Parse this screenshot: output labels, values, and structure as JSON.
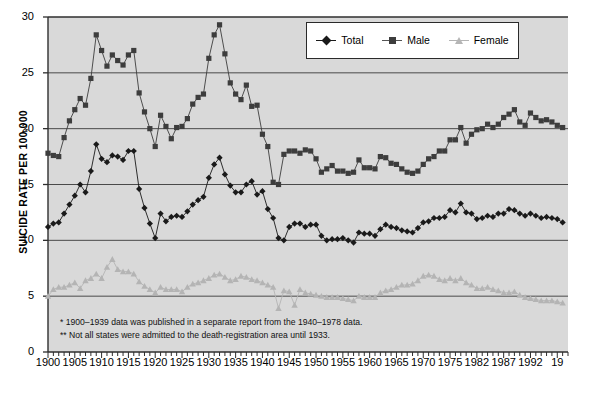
{
  "chart_data": {
    "type": "line",
    "title": "",
    "xlabel": "",
    "ylabel": "SUICIDE RATE PER 100,000",
    "ylim": [
      0,
      30
    ],
    "yticks": [
      0,
      5,
      10,
      15,
      20,
      25,
      30
    ],
    "xlim": [
      1900,
      1997
    ],
    "xtick_labels": [
      "1900",
      "1905",
      "1910",
      "1915",
      "1920",
      "1925",
      "1930",
      "1935",
      "1940",
      "1945",
      "1950",
      "1955",
      "1960",
      "1965",
      "1970",
      "1975",
      "1982",
      "1987",
      "1992",
      "19"
    ],
    "xtick_years": [
      1900,
      1905,
      1910,
      1915,
      1920,
      1925,
      1930,
      1935,
      1940,
      1945,
      1950,
      1955,
      1960,
      1965,
      1970,
      1975,
      1980,
      1985,
      1990,
      1995
    ],
    "grid": "horizontal",
    "legend_position": "top-right",
    "plot_background": "#d9d9d9",
    "x": [
      1900,
      1901,
      1902,
      1903,
      1904,
      1905,
      1906,
      1907,
      1908,
      1909,
      1910,
      1911,
      1912,
      1913,
      1914,
      1915,
      1916,
      1917,
      1918,
      1919,
      1920,
      1921,
      1922,
      1923,
      1924,
      1925,
      1926,
      1927,
      1928,
      1929,
      1930,
      1931,
      1932,
      1933,
      1934,
      1935,
      1936,
      1937,
      1938,
      1939,
      1940,
      1941,
      1942,
      1943,
      1944,
      1945,
      1946,
      1947,
      1948,
      1949,
      1950,
      1951,
      1952,
      1953,
      1954,
      1955,
      1956,
      1957,
      1958,
      1959,
      1960,
      1961,
      1962,
      1963,
      1964,
      1965,
      1966,
      1967,
      1968,
      1969,
      1970,
      1971,
      1972,
      1973,
      1974,
      1975,
      1976,
      1977,
      1978,
      1979,
      1980,
      1981,
      1982,
      1983,
      1984,
      1985,
      1986,
      1987,
      1988,
      1989,
      1990,
      1991,
      1992,
      1993,
      1994,
      1995,
      1996
    ],
    "series": [
      {
        "name": "Total",
        "color": "#1a1a1a",
        "marker": "diamond",
        "values": [
          11.2,
          11.5,
          11.6,
          12.4,
          13.2,
          14.0,
          15.0,
          14.3,
          16.2,
          18.6,
          17.3,
          17.0,
          17.6,
          17.5,
          17.2,
          18.0,
          18.0,
          14.6,
          12.9,
          11.5,
          10.2,
          12.4,
          11.7,
          12.1,
          12.2,
          12.1,
          12.6,
          13.2,
          13.6,
          13.9,
          15.6,
          16.8,
          17.4,
          15.9,
          14.9,
          14.3,
          14.3,
          15.0,
          15.3,
          14.1,
          14.4,
          12.8,
          12.0,
          10.2,
          10.0,
          11.2,
          11.5,
          11.5,
          11.2,
          11.4,
          11.4,
          10.4,
          10.0,
          10.1,
          10.1,
          10.2,
          10.0,
          9.8,
          10.7,
          10.6,
          10.6,
          10.4,
          11.0,
          11.4,
          11.2,
          11.1,
          10.9,
          10.8,
          10.7,
          11.1,
          11.6,
          11.7,
          12.0,
          12.0,
          12.1,
          12.7,
          12.5,
          13.3,
          12.5,
          12.4,
          11.9,
          12.0,
          12.2,
          12.1,
          12.4,
          12.4,
          12.8,
          12.7,
          12.4,
          12.2,
          12.4,
          12.2,
          12.0,
          12.1,
          12.0,
          11.9,
          11.6
        ]
      },
      {
        "name": "Male",
        "color": "#3d3d3d",
        "marker": "square",
        "values": [
          17.8,
          17.6,
          17.5,
          19.2,
          20.7,
          21.7,
          22.7,
          22.1,
          24.5,
          28.4,
          27.0,
          25.6,
          26.6,
          26.1,
          25.7,
          26.6,
          27.0,
          23.2,
          21.5,
          20.0,
          18.4,
          21.2,
          20.2,
          19.1,
          20.1,
          20.2,
          20.9,
          22.2,
          22.8,
          23.1,
          26.3,
          28.4,
          29.3,
          26.7,
          24.1,
          23.1,
          22.6,
          23.9,
          22.0,
          22.1,
          19.5,
          18.4,
          15.2,
          15.0,
          17.7,
          18.0,
          18.0,
          17.8,
          18.1,
          18.0,
          17.3,
          16.1,
          16.4,
          16.7,
          16.2,
          16.2,
          16.0,
          16.1,
          17.2,
          16.5,
          16.5,
          16.4,
          17.5,
          17.4,
          16.9,
          16.8,
          16.4,
          16.1,
          16.0,
          16.2,
          16.8,
          17.3,
          17.5,
          18.0,
          18.0,
          19.0,
          19.0,
          20.1,
          18.7,
          19.5,
          19.9,
          20.0,
          20.4,
          20.1,
          20.4,
          21.0,
          21.3,
          21.7,
          20.6,
          20.3,
          21.4,
          21.0,
          20.7,
          20.8,
          20.6,
          20.3,
          20.1
        ]
      },
      {
        "name": "Female",
        "color": "#b4b4b4",
        "marker": "triangle",
        "values": [
          5.0,
          5.6,
          5.8,
          5.8,
          6.0,
          6.2,
          5.7,
          6.4,
          6.6,
          7.0,
          6.6,
          7.6,
          8.3,
          7.4,
          7.2,
          7.2,
          7.0,
          6.3,
          5.9,
          5.6,
          5.3,
          5.8,
          5.6,
          5.6,
          5.6,
          5.4,
          5.8,
          6.1,
          6.2,
          6.4,
          6.6,
          6.9,
          7.0,
          6.7,
          6.4,
          6.5,
          6.8,
          6.7,
          6.5,
          6.4,
          6.2,
          6.0,
          5.8,
          3.9,
          5.5,
          5.4,
          4.2,
          5.6,
          5.3,
          5.2,
          5.1,
          5.0,
          4.9,
          4.9,
          4.9,
          4.8,
          4.7,
          4.6,
          5.0,
          4.9,
          4.9,
          4.9,
          5.3,
          5.5,
          5.6,
          5.8,
          6.0,
          6.0,
          6.1,
          6.4,
          6.8,
          6.9,
          6.8,
          6.5,
          6.4,
          6.6,
          6.4,
          6.6,
          6.2,
          6.0,
          5.7,
          5.7,
          5.8,
          5.6,
          5.5,
          5.3,
          5.3,
          5.4,
          5.1,
          4.9,
          4.8,
          4.7,
          4.6,
          4.6,
          4.6,
          4.5,
          4.4
        ]
      }
    ]
  },
  "legend": {
    "items": [
      {
        "label": "Total"
      },
      {
        "label": "Male"
      },
      {
        "label": "Female"
      }
    ]
  },
  "notes": [
    "* 1900–1939 data was published in a separate report from the 1940–1978 data.",
    "** Not all states were admitted to the death-registration area until 1933."
  ]
}
